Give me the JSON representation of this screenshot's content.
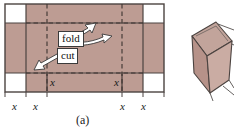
{
  "figure": {
    "caption": "(a)",
    "panel_label": "(a)",
    "colors": {
      "shaded_fill": "#bd9c93",
      "shaded_fill_dark": "#b08d84",
      "outline": "#4b4340",
      "dashed": "#3d3330",
      "white_fill": "#ffffff",
      "box_top_face": "#c2a49b",
      "box_front_face": "#b1897f",
      "box_side_face": "#cbb0a8",
      "text": "#1a1a1a"
    }
  },
  "net": {
    "description": "Rectangular sheet with shaded region, corner squares removed, dashed fold lines",
    "annotations": {
      "fold_label": "fold",
      "cut_label": "cut"
    },
    "inner_dimension_labels": [
      {
        "text": "x",
        "position": "inner-left"
      },
      {
        "text": "x",
        "position": "inner-right"
      }
    ],
    "bottom_dimension_labels": [
      {
        "text": "x",
        "position": "far-left"
      },
      {
        "text": "x",
        "position": "left"
      },
      {
        "text": "x",
        "position": "right"
      },
      {
        "text": "x",
        "position": "far-right"
      }
    ]
  },
  "box": {
    "description": "Open-top folded box in 3D perspective",
    "label": ""
  }
}
